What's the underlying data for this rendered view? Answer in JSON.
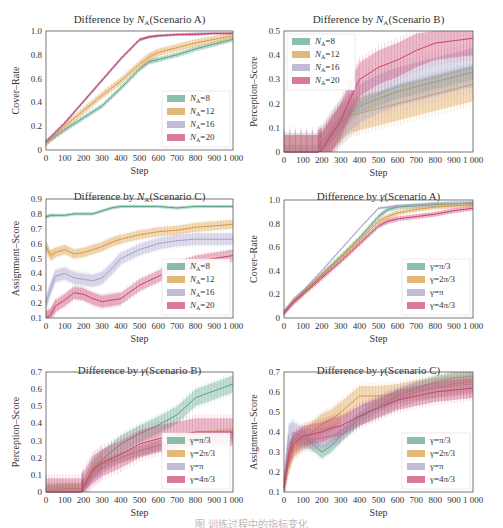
{
  "colors": {
    "green": "#5aa387",
    "orange": "#d99a43",
    "lavender": "#a5a0c8",
    "red": "#c9426e"
  },
  "chart_data": [
    {
      "id": "na_a",
      "type": "line",
      "title": "Difference by N_A(Scenario A)",
      "title_parts": [
        "Difference by ",
        "N",
        "A",
        "(Scenario A)"
      ],
      "xlabel": "Step",
      "ylabel": "Cover–Rate",
      "xlim": [
        0,
        1000
      ],
      "ylim": [
        0,
        1.0
      ],
      "xticks": [
        "0",
        "100",
        "200",
        "300",
        "400",
        "500",
        "600",
        "700",
        "800",
        "900",
        "1 000"
      ],
      "yticks": [
        "0",
        "0.2",
        "0.4",
        "0.6",
        "0.8",
        "1.0"
      ],
      "ytick_values": [
        0,
        0.2,
        0.4,
        0.6,
        0.8,
        1.0
      ],
      "legend_position": "lower right",
      "x": [
        0,
        100,
        200,
        300,
        400,
        500,
        550,
        600,
        700,
        800,
        900,
        1000
      ],
      "series": [
        {
          "name": "N_A=8",
          "label_sub": [
            "N",
            "A",
            "=8"
          ],
          "color": "green",
          "values": [
            0.06,
            0.17,
            0.27,
            0.37,
            0.52,
            0.68,
            0.74,
            0.76,
            0.8,
            0.85,
            0.89,
            0.93
          ],
          "band": 0.02
        },
        {
          "name": "N_A=12",
          "label_sub": [
            "N",
            "A",
            "=12"
          ],
          "color": "orange",
          "values": [
            0.06,
            0.2,
            0.33,
            0.46,
            0.58,
            0.72,
            0.78,
            0.82,
            0.86,
            0.9,
            0.93,
            0.96
          ],
          "band": 0.03
        },
        {
          "name": "N_A=16",
          "label_sub": [
            "N",
            "A",
            "=16"
          ],
          "color": "lavender",
          "values": [
            0.06,
            0.22,
            0.4,
            0.58,
            0.76,
            0.92,
            0.95,
            0.96,
            0.97,
            0.98,
            0.98,
            0.98
          ],
          "band": 0.01
        },
        {
          "name": "N_A=20",
          "label_sub": [
            "N",
            "A",
            "=20"
          ],
          "color": "red",
          "values": [
            0.07,
            0.23,
            0.41,
            0.59,
            0.77,
            0.93,
            0.95,
            0.96,
            0.97,
            0.97,
            0.98,
            0.98
          ],
          "band": 0.01
        }
      ]
    },
    {
      "id": "na_b",
      "type": "line",
      "title": "Difference by N_A(Scenario B)",
      "title_parts": [
        "Difference by ",
        "N",
        "A",
        "(Scenario B)"
      ],
      "xlabel": "Step",
      "ylabel": "Perception–Score",
      "xlim": [
        0,
        1000
      ],
      "ylim": [
        0,
        0.5
      ],
      "xticks": [
        "0",
        "100",
        "200",
        "300",
        "400",
        "500",
        "600",
        "700",
        "800",
        "900",
        "1 000"
      ],
      "yticks": [
        "0",
        "0.1",
        "0.2",
        "0.3",
        "0.4",
        "0.5"
      ],
      "ytick_values": [
        0,
        0.1,
        0.2,
        0.3,
        0.4,
        0.5
      ],
      "legend_position": "upper left",
      "x": [
        0,
        180,
        200,
        250,
        300,
        350,
        400,
        500,
        600,
        700,
        800,
        900,
        1000
      ],
      "series": [
        {
          "name": "N_A=8",
          "label_sub": [
            "N",
            "A",
            "=8"
          ],
          "color": "green",
          "values": [
            0,
            0,
            0.01,
            0.07,
            0.12,
            0.16,
            0.19,
            0.22,
            0.25,
            0.27,
            0.29,
            0.31,
            0.33
          ],
          "band": 0.03
        },
        {
          "name": "N_A=12",
          "label_sub": [
            "N",
            "A",
            "=12"
          ],
          "color": "orange",
          "values": [
            0,
            0,
            0.01,
            0.07,
            0.12,
            0.15,
            0.16,
            0.18,
            0.2,
            0.22,
            0.24,
            0.26,
            0.28
          ],
          "band": 0.07
        },
        {
          "name": "N_A=16",
          "label_sub": [
            "N",
            "A",
            "=16"
          ],
          "color": "lavender",
          "values": [
            0,
            0,
            0.01,
            0.07,
            0.12,
            0.17,
            0.2,
            0.24,
            0.27,
            0.29,
            0.31,
            0.33,
            0.35
          ],
          "band": 0.08
        },
        {
          "name": "N_A=20",
          "label_sub": [
            "N",
            "A",
            "=20"
          ],
          "color": "red",
          "values": [
            0,
            0,
            0.01,
            0.07,
            0.13,
            0.22,
            0.3,
            0.35,
            0.38,
            0.42,
            0.45,
            0.46,
            0.47
          ],
          "band": 0.07
        }
      ]
    },
    {
      "id": "na_c",
      "type": "line",
      "title": "Difference by N_A(Scenario C)",
      "title_parts": [
        "Difference by ",
        "N",
        "A",
        "(Scenario C)"
      ],
      "xlabel": "Step",
      "ylabel": "Assignment–Score",
      "xlim": [
        0,
        1000
      ],
      "ylim": [
        0.1,
        0.9
      ],
      "xticks": [
        "0",
        "100",
        "200",
        "300",
        "400",
        "500",
        "600",
        "700",
        "800",
        "900",
        "1 000"
      ],
      "yticks": [
        "0.1",
        "0.2",
        "0.3",
        "0.4",
        "0.5",
        "0.6",
        "0.7",
        "0.8",
        "0.9"
      ],
      "ytick_values": [
        0.1,
        0.2,
        0.3,
        0.4,
        0.5,
        0.6,
        0.7,
        0.8,
        0.9
      ],
      "legend_position": "lower right",
      "x": [
        0,
        25,
        50,
        100,
        150,
        200,
        250,
        300,
        350,
        400,
        500,
        600,
        700,
        800,
        900,
        1000
      ],
      "series": [
        {
          "name": "N_A=8",
          "label_sub": [
            "N",
            "A",
            "=8"
          ],
          "color": "green",
          "values": [
            0.78,
            0.79,
            0.79,
            0.79,
            0.8,
            0.8,
            0.8,
            0.82,
            0.84,
            0.85,
            0.85,
            0.85,
            0.84,
            0.85,
            0.85,
            0.85
          ],
          "band": 0.01
        },
        {
          "name": "N_A=12",
          "label_sub": [
            "N",
            "A",
            "=12"
          ],
          "color": "orange",
          "values": [
            0.58,
            0.52,
            0.54,
            0.56,
            0.53,
            0.54,
            0.56,
            0.58,
            0.61,
            0.63,
            0.66,
            0.68,
            0.69,
            0.71,
            0.72,
            0.73
          ],
          "band": 0.03
        },
        {
          "name": "N_A=16",
          "label_sub": [
            "N",
            "A",
            "=16"
          ],
          "color": "lavender",
          "values": [
            0.2,
            0.3,
            0.38,
            0.4,
            0.37,
            0.36,
            0.35,
            0.37,
            0.43,
            0.5,
            0.56,
            0.6,
            0.62,
            0.63,
            0.63,
            0.63
          ],
          "band": 0.04
        },
        {
          "name": "N_A=20",
          "label_sub": [
            "N",
            "A",
            "=20"
          ],
          "color": "red",
          "values": [
            0.1,
            0.12,
            0.18,
            0.22,
            0.27,
            0.26,
            0.23,
            0.21,
            0.22,
            0.23,
            0.32,
            0.38,
            0.44,
            0.48,
            0.5,
            0.52
          ],
          "band": 0.04
        }
      ]
    },
    {
      "id": "g_a",
      "type": "line",
      "title": "Difference by γ(Scenario A)",
      "title_parts": [
        "Difference by ",
        "γ",
        "",
        "(Scenario A)"
      ],
      "xlabel": "Step",
      "ylabel": "Cover–Rate",
      "xlim": [
        0,
        1000
      ],
      "ylim": [
        0,
        1.0
      ],
      "xticks": [
        "0",
        "100",
        "200",
        "300",
        "400",
        "500",
        "600",
        "700",
        "800",
        "900",
        "1 000"
      ],
      "yticks": [
        "0",
        "0.2",
        "0.4",
        "0.6",
        "0.8",
        "1.0"
      ],
      "ytick_values": [
        0,
        0.2,
        0.4,
        0.6,
        0.8,
        1.0
      ],
      "legend_position": "lower right",
      "x": [
        0,
        50,
        100,
        200,
        300,
        400,
        500,
        550,
        600,
        700,
        800,
        900,
        1000
      ],
      "series": [
        {
          "name": "γ=π/3",
          "label_sub": [
            "γ=π/3",
            "",
            ""
          ],
          "color": "green",
          "values": [
            0.05,
            0.15,
            0.22,
            0.37,
            0.52,
            0.68,
            0.86,
            0.92,
            0.94,
            0.95,
            0.96,
            0.97,
            0.97
          ],
          "band": 0.02
        },
        {
          "name": "γ=2π/3",
          "label_sub": [
            "γ=2π/3",
            "",
            ""
          ],
          "color": "orange",
          "values": [
            0.05,
            0.14,
            0.21,
            0.36,
            0.51,
            0.66,
            0.82,
            0.86,
            0.89,
            0.92,
            0.94,
            0.95,
            0.96
          ],
          "band": 0.02
        },
        {
          "name": "γ=π",
          "label_sub": [
            "γ=π",
            "",
            ""
          ],
          "color": "lavender",
          "values": [
            0.05,
            0.15,
            0.23,
            0.4,
            0.58,
            0.76,
            0.93,
            0.94,
            0.95,
            0.96,
            0.97,
            0.97,
            0.98
          ],
          "band": 0.01
        },
        {
          "name": "γ=4π/3",
          "label_sub": [
            "γ=4π/3",
            "",
            ""
          ],
          "color": "red",
          "values": [
            0.04,
            0.13,
            0.2,
            0.34,
            0.48,
            0.63,
            0.78,
            0.82,
            0.84,
            0.86,
            0.88,
            0.91,
            0.93
          ],
          "band": 0.02
        }
      ]
    },
    {
      "id": "g_b",
      "type": "line",
      "title": "Difference by γ(Scenario B)",
      "title_parts": [
        "Difference by ",
        "γ",
        "",
        "(Scenario B)"
      ],
      "xlabel": "Step",
      "ylabel": "Perception–Score",
      "xlim": [
        0,
        1000
      ],
      "ylim": [
        0,
        0.7
      ],
      "xticks": [
        "0",
        "100",
        "200",
        "300",
        "400",
        "500",
        "600",
        "700",
        "800",
        "900",
        "1 000"
      ],
      "yticks": [
        "0",
        "0.1",
        "0.2",
        "0.3",
        "0.4",
        "0.5",
        "0.6",
        "0.7"
      ],
      "ytick_values": [
        0,
        0.1,
        0.2,
        0.3,
        0.4,
        0.5,
        0.6,
        0.7
      ],
      "legend_position": "lower right",
      "x": [
        0,
        90,
        190,
        200,
        250,
        300,
        400,
        500,
        600,
        700,
        800,
        900,
        1000
      ],
      "series": [
        {
          "name": "γ=π/3",
          "label_sub": [
            "γ=π/3",
            "",
            ""
          ],
          "color": "green",
          "values": [
            0,
            0,
            0,
            0.02,
            0.13,
            0.19,
            0.28,
            0.34,
            0.39,
            0.45,
            0.55,
            0.59,
            0.63
          ],
          "band": 0.05
        },
        {
          "name": "γ=2π/3",
          "label_sub": [
            "γ=2π/3",
            "",
            ""
          ],
          "color": "orange",
          "values": [
            0,
            0.02,
            0.02,
            0.03,
            0.12,
            0.16,
            0.2,
            0.24,
            0.27,
            0.3,
            0.32,
            0.33,
            0.34
          ],
          "band": 0.03
        },
        {
          "name": "γ=π",
          "label_sub": [
            "γ=π",
            "",
            ""
          ],
          "color": "lavender",
          "values": [
            0,
            0,
            0,
            0.02,
            0.1,
            0.14,
            0.2,
            0.24,
            0.27,
            0.29,
            0.31,
            0.32,
            0.32
          ],
          "band": 0.03
        },
        {
          "name": "γ=4π/3",
          "label_sub": [
            "γ=4π/3",
            "",
            ""
          ],
          "color": "red",
          "values": [
            0,
            0,
            0,
            0.03,
            0.13,
            0.17,
            0.22,
            0.28,
            0.31,
            0.33,
            0.35,
            0.35,
            0.35
          ],
          "band": 0.08
        }
      ]
    },
    {
      "id": "g_c",
      "type": "line",
      "title": "Difference by γ(Scenario C)",
      "title_parts": [
        "Difference by ",
        "γ",
        "",
        "(Scenario C)"
      ],
      "xlabel": "Step",
      "ylabel": "Assignment–Score",
      "xlim": [
        0,
        1000
      ],
      "ylim": [
        0.1,
        0.7
      ],
      "xticks": [
        "0",
        "100",
        "200",
        "300",
        "400",
        "500",
        "600",
        "700",
        "800",
        "900",
        "1 000"
      ],
      "yticks": [
        "0.1",
        "0.2",
        "0.3",
        "0.4",
        "0.5",
        "0.6",
        "0.7"
      ],
      "ytick_values": [
        0.1,
        0.2,
        0.3,
        0.4,
        0.5,
        0.6,
        0.7
      ],
      "legend_position": "lower right",
      "x": [
        0,
        25,
        50,
        100,
        150,
        200,
        250,
        300,
        400,
        500,
        600,
        700,
        800,
        900,
        1000
      ],
      "series": [
        {
          "name": "γ=π/3",
          "label_sub": [
            "γ=π/3",
            "",
            ""
          ],
          "color": "green",
          "values": [
            0.12,
            0.3,
            0.36,
            0.38,
            0.34,
            0.3,
            0.33,
            0.38,
            0.47,
            0.53,
            0.58,
            0.62,
            0.65,
            0.67,
            0.68
          ],
          "band": 0.03
        },
        {
          "name": "γ=2π/3",
          "label_sub": [
            "γ=2π/3",
            "",
            ""
          ],
          "color": "orange",
          "values": [
            0.12,
            0.25,
            0.32,
            0.36,
            0.4,
            0.44,
            0.46,
            0.5,
            0.58,
            0.58,
            0.59,
            0.61,
            0.62,
            0.64,
            0.65
          ],
          "band": 0.05
        },
        {
          "name": "γ=π",
          "label_sub": [
            "γ=π",
            "",
            ""
          ],
          "color": "lavender",
          "values": [
            0.15,
            0.38,
            0.4,
            0.37,
            0.36,
            0.37,
            0.38,
            0.4,
            0.48,
            0.53,
            0.57,
            0.6,
            0.62,
            0.63,
            0.64
          ],
          "band": 0.05
        },
        {
          "name": "γ=4π/3",
          "label_sub": [
            "γ=4π/3",
            "",
            ""
          ],
          "color": "red",
          "values": [
            0.12,
            0.28,
            0.34,
            0.38,
            0.39,
            0.4,
            0.42,
            0.43,
            0.48,
            0.52,
            0.56,
            0.58,
            0.6,
            0.61,
            0.62
          ],
          "band": 0.05
        }
      ]
    }
  ],
  "caption": "图 训练过程中的指标变化"
}
